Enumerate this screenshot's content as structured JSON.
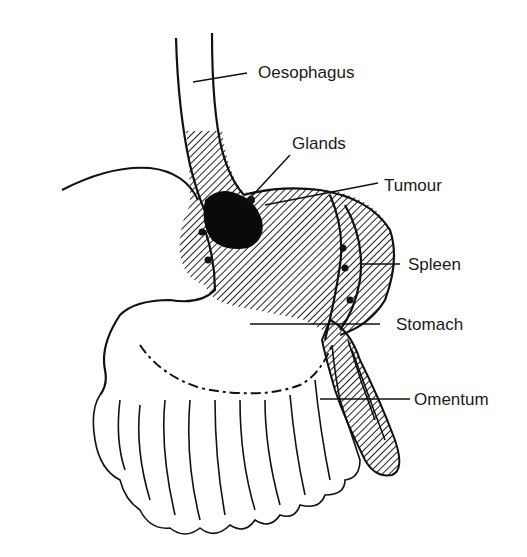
{
  "diagram": {
    "type": "anatomical-illustration",
    "labels": [
      {
        "id": "oesophagus",
        "text": "Oesophagus"
      },
      {
        "id": "glands",
        "text": "Glands"
      },
      {
        "id": "tumour",
        "text": "Tumour"
      },
      {
        "id": "spleen",
        "text": "Spleen"
      },
      {
        "id": "stomach",
        "text": "Stomach"
      },
      {
        "id": "omentum",
        "text": "Omentum"
      }
    ],
    "colors": {
      "ink": "#111111",
      "background": "#ffffff",
      "hatch": "#222222"
    }
  }
}
